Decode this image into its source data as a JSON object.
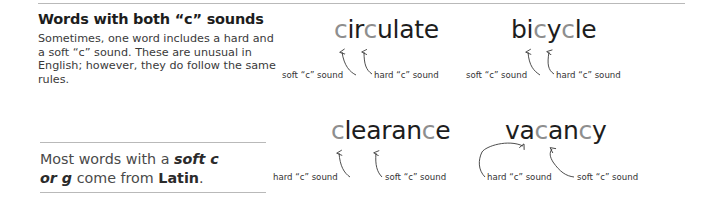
{
  "dividers": {
    "top_rule": "horizontal-rule",
    "box_top_rule": "horizontal-rule",
    "box_bottom_rule": "horizontal-rule"
  },
  "left_column": {
    "heading": "Words with both “c” sounds",
    "paragraph": "Sometimes, one word includes a hard and a soft “c” sound. These are unusual in English; however, they do follow the same rules.",
    "rule_box": {
      "line1_plain": "Most words with a ",
      "line1_bold_italic": "soft c",
      "line2_bold_italic": "or g",
      "line2_plain": " come from ",
      "line2_bold": "Latin",
      "line2_end": "."
    }
  },
  "examples": [
    {
      "id": "circulate",
      "word": "circulate",
      "segments": [
        {
          "text": "c",
          "highlight": true
        },
        {
          "text": "ir",
          "highlight": false
        },
        {
          "text": "c",
          "highlight": true
        },
        {
          "text": "ulate",
          "highlight": false
        }
      ],
      "labels": [
        {
          "id": "circulate-soft",
          "text": "soft “c” sound",
          "target": "first-c"
        },
        {
          "id": "circulate-hard",
          "text": "hard “c” sound",
          "target": "second-c"
        }
      ]
    },
    {
      "id": "bicycle",
      "word": "bicycle",
      "segments": [
        {
          "text": "bi",
          "highlight": false
        },
        {
          "text": "c",
          "highlight": true
        },
        {
          "text": "y",
          "highlight": false
        },
        {
          "text": "c",
          "highlight": true
        },
        {
          "text": "le",
          "highlight": false
        }
      ],
      "labels": [
        {
          "id": "bicycle-soft",
          "text": "soft “c” sound",
          "target": "first-c"
        },
        {
          "id": "bicycle-hard",
          "text": "hard “c” sound",
          "target": "second-c"
        }
      ]
    },
    {
      "id": "clearance",
      "word": "clearance",
      "segments": [
        {
          "text": "c",
          "highlight": true
        },
        {
          "text": "learan",
          "highlight": false
        },
        {
          "text": "c",
          "highlight": true
        },
        {
          "text": "e",
          "highlight": false
        }
      ],
      "labels": [
        {
          "id": "clearance-hard",
          "text": "hard “c” sound",
          "target": "first-c"
        },
        {
          "id": "clearance-soft",
          "text": "soft “c” sound",
          "target": "second-c"
        }
      ]
    },
    {
      "id": "vacancy",
      "word": "vacancy",
      "segments": [
        {
          "text": "va",
          "highlight": false
        },
        {
          "text": "c",
          "highlight": true
        },
        {
          "text": "an",
          "highlight": false
        },
        {
          "text": "c",
          "highlight": true
        },
        {
          "text": "y",
          "highlight": false
        }
      ],
      "labels": [
        {
          "id": "vacancy-hard",
          "text": "hard “c” sound",
          "target": "first-c"
        },
        {
          "id": "vacancy-soft",
          "text": "soft “c” sound",
          "target": "second-c"
        }
      ]
    }
  ],
  "colors": {
    "text": "#1d1d1d",
    "body_text": "#3a3a3a",
    "highlight_letter": "#8e8e8e",
    "rule": "#b9b9b9",
    "connector": "#3a3a3a"
  }
}
